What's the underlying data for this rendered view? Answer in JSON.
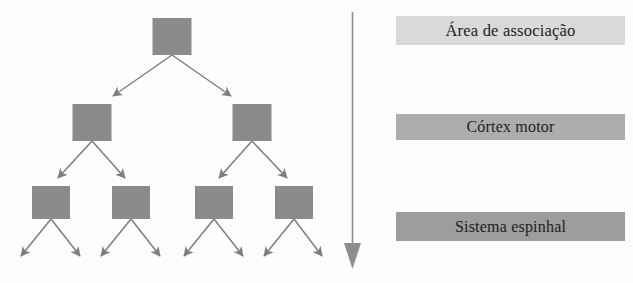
{
  "diagram": {
    "tree": {
      "node_fill": "#8b8b8b",
      "arrow_color": "#7d7d7d",
      "levels": [
        {
          "level": 1,
          "count": 1,
          "nodes": [
            {
              "cx": 172,
              "cy": 36
            }
          ]
        },
        {
          "level": 2,
          "count": 2,
          "nodes": [
            {
              "cx": 92,
              "cy": 122
            },
            {
              "cx": 252,
              "cy": 122
            }
          ]
        },
        {
          "level": 3,
          "count": 4,
          "nodes": [
            {
              "cx": 51,
              "cy": 202
            },
            {
              "cx": 131,
              "cy": 202
            },
            {
              "cx": 214,
              "cy": 202
            },
            {
              "cx": 294,
              "cy": 202
            }
          ]
        },
        {
          "level": 4,
          "count": 8,
          "nodes": []
        }
      ],
      "node_width": 39,
      "node_height": 36,
      "node_height_l3": 33
    },
    "flow_arrow": {
      "name": "downward-flow-arrow",
      "color": "#8e8e8e",
      "direction": "down",
      "x": 18,
      "y_start": 12,
      "y_end": 268
    },
    "bars": [
      {
        "id": "bar-0",
        "label": "Área de associação",
        "color": "#d9d9d7"
      },
      {
        "id": "bar-1",
        "label": "Córtex motor",
        "color": "#adadad"
      },
      {
        "id": "bar-2",
        "label": "Sistema espinhal",
        "color": "#9d9d9d"
      }
    ]
  }
}
